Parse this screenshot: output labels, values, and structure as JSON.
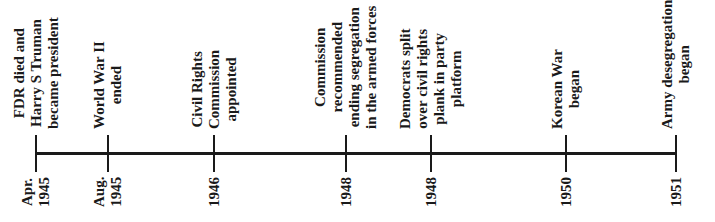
{
  "timeline": {
    "axis": {
      "x_start": 36,
      "x_end": 677,
      "y": 153,
      "color": "#1a1a1a"
    },
    "events": [
      {
        "x": 36,
        "date": "Apr.\n1945",
        "label": "FDR died and\nHarry S Truman\nbecame president"
      },
      {
        "x": 108,
        "date": "Aug.\n1945",
        "label": "World War II\nended"
      },
      {
        "x": 214,
        "date": "1946",
        "label": "Civil Rights\nCommission\nappointed"
      },
      {
        "x": 346,
        "date": "1948",
        "label": "Commission\nrecommended\nending segregation\nin the armed forces"
      },
      {
        "x": 431,
        "date": "1948",
        "label": "Democrats split\nover civil rights\nplank in party\nplatform"
      },
      {
        "x": 566,
        "date": "1950",
        "label": "Korean War\nbegan"
      },
      {
        "x": 676,
        "date": "1951",
        "label": "Army desegregation\nbegan"
      }
    ]
  }
}
